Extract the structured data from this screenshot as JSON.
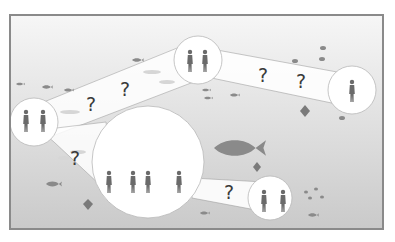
{
  "scene": {
    "description": "Underwater scene: circles containing human silhouettes connected by bands, with question marks along the bands",
    "colors": {
      "frame": "#8a8a8a",
      "water_top": "#f4f4f4",
      "water_bottom": "#c8c8c8",
      "bubble_fill": "#ffffff",
      "bubble_stroke": "#b8b8b8",
      "silhouette": "#6a6a6a",
      "fish": "#8a8a8a",
      "question_mark": "#3a3a3a"
    },
    "nodes": [
      {
        "id": "left",
        "cx": 32,
        "cy": 120,
        "r": 24,
        "people": 2
      },
      {
        "id": "top-center",
        "cx": 196,
        "cy": 58,
        "r": 24,
        "people": 2
      },
      {
        "id": "right",
        "cx": 350,
        "cy": 88,
        "r": 24,
        "people": 1
      },
      {
        "id": "big-center",
        "cx": 146,
        "cy": 160,
        "r": 56,
        "people": 4
      },
      {
        "id": "bottom-right",
        "cx": 268,
        "cy": 196,
        "r": 22,
        "people": 2
      }
    ],
    "question_marks": [
      {
        "label": "?",
        "x": 90,
        "y": 103
      },
      {
        "label": "?",
        "x": 124,
        "y": 88
      },
      {
        "label": "?",
        "x": 262,
        "y": 74
      },
      {
        "label": "?",
        "x": 300,
        "y": 80
      },
      {
        "label": "?",
        "x": 74,
        "y": 157
      },
      {
        "label": "?",
        "x": 228,
        "y": 191
      }
    ]
  }
}
